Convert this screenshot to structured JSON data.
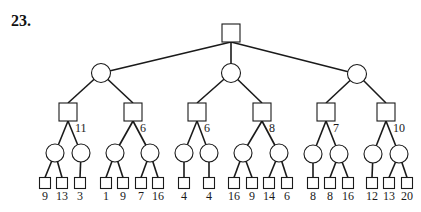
{
  "problem_number": "23.",
  "tree": {
    "root": {
      "type": "max-square",
      "x": 231,
      "y": 33
    },
    "level1": [
      {
        "type": "chance-circle",
        "x": 101,
        "y": 73
      },
      {
        "type": "chance-circle",
        "x": 231,
        "y": 73
      },
      {
        "type": "chance-circle",
        "x": 357,
        "y": 74
      }
    ],
    "level2": [
      {
        "type": "max-square",
        "x": 68,
        "y": 112,
        "parent": 0,
        "label": "11"
      },
      {
        "type": "max-square",
        "x": 133,
        "y": 112,
        "parent": 0,
        "label": "6"
      },
      {
        "type": "max-square",
        "x": 197,
        "y": 112,
        "parent": 1,
        "label": "6"
      },
      {
        "type": "max-square",
        "x": 262,
        "y": 112,
        "parent": 1,
        "label": "8"
      },
      {
        "type": "max-square",
        "x": 326,
        "y": 112,
        "parent": 2,
        "label": "7"
      },
      {
        "type": "max-square",
        "x": 386,
        "y": 112,
        "parent": 2,
        "label": "10"
      }
    ],
    "level3": [
      {
        "type": "chance-circle",
        "x": 55,
        "y": 153,
        "parent": 0
      },
      {
        "type": "chance-circle",
        "x": 81,
        "y": 153,
        "parent": 0
      },
      {
        "type": "chance-circle",
        "x": 115,
        "y": 153,
        "parent": 1
      },
      {
        "type": "chance-circle",
        "x": 150,
        "y": 153,
        "parent": 1
      },
      {
        "type": "chance-circle",
        "x": 184,
        "y": 153,
        "parent": 2
      },
      {
        "type": "chance-circle",
        "x": 209,
        "y": 153,
        "parent": 2
      },
      {
        "type": "chance-circle",
        "x": 243,
        "y": 153,
        "parent": 3
      },
      {
        "type": "chance-circle",
        "x": 279,
        "y": 153,
        "parent": 3
      },
      {
        "type": "chance-circle",
        "x": 313,
        "y": 154,
        "parent": 4
      },
      {
        "type": "chance-circle",
        "x": 339,
        "y": 154,
        "parent": 4
      },
      {
        "type": "chance-circle",
        "x": 373,
        "y": 154,
        "parent": 5
      },
      {
        "type": "chance-circle",
        "x": 399,
        "y": 154,
        "parent": 5
      }
    ],
    "leaves": [
      {
        "x": 45,
        "parent": 0,
        "value": "9"
      },
      {
        "x": 62,
        "parent": 0,
        "value": "13"
      },
      {
        "x": 80,
        "parent": 1,
        "value": "3"
      },
      {
        "x": 106,
        "parent": 2,
        "value": "1"
      },
      {
        "x": 123,
        "parent": 2,
        "value": "9"
      },
      {
        "x": 141,
        "parent": 3,
        "value": "7"
      },
      {
        "x": 158,
        "parent": 3,
        "value": "16"
      },
      {
        "x": 184,
        "parent": 4,
        "value": "4"
      },
      {
        "x": 209,
        "parent": 5,
        "value": "4"
      },
      {
        "x": 234,
        "parent": 6,
        "value": "16"
      },
      {
        "x": 252,
        "parent": 6,
        "value": "9"
      },
      {
        "x": 269,
        "parent": 7,
        "value": "14"
      },
      {
        "x": 287,
        "parent": 7,
        "value": "6"
      },
      {
        "x": 313,
        "parent": 8,
        "value": "8"
      },
      {
        "x": 330,
        "parent": 9,
        "value": "8"
      },
      {
        "x": 348,
        "parent": 9,
        "value": "16"
      },
      {
        "x": 372,
        "parent": 10,
        "value": "12"
      },
      {
        "x": 389,
        "parent": 11,
        "value": "13"
      },
      {
        "x": 407,
        "parent": 11,
        "value": "20"
      }
    ]
  },
  "style": {
    "stroke": "#1a1a1a",
    "fill": "#ffffff"
  }
}
